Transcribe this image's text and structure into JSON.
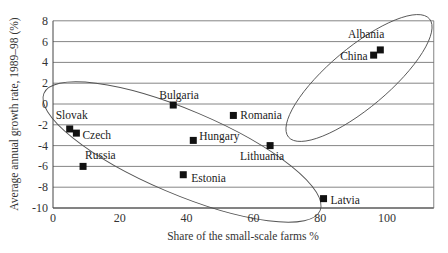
{
  "chart_data": {
    "type": "scatter",
    "title": "",
    "xlabel": "Share of the small-scale farms %",
    "ylabel": "Average annual growth rate, 1989–98 (%)",
    "xlim": [
      0,
      114
    ],
    "ylim": [
      -10,
      8
    ],
    "xticks": [
      0,
      20,
      40,
      60,
      80,
      100
    ],
    "yticks": [
      8,
      6,
      4,
      2,
      0,
      -2,
      -4,
      -6,
      -8,
      -10
    ],
    "grid": "horizontal",
    "legend": "none",
    "points": [
      {
        "label": "Slovak",
        "x": 5,
        "y": -2.4
      },
      {
        "label": "Czech",
        "x": 7,
        "y": -2.8
      },
      {
        "label": "Russia",
        "x": 9,
        "y": -6.0
      },
      {
        "label": "Bulgaria",
        "x": 36,
        "y": -0.1
      },
      {
        "label": "Romania",
        "x": 54,
        "y": -1.1
      },
      {
        "label": "Hungary",
        "x": 42,
        "y": -3.5
      },
      {
        "label": "Lithuania",
        "x": 65,
        "y": -4.0
      },
      {
        "label": "Estonia",
        "x": 39,
        "y": -6.8
      },
      {
        "label": "Latvia",
        "x": 81,
        "y": -9.1
      },
      {
        "label": "China",
        "x": 96,
        "y": 4.7
      },
      {
        "label": "Albania",
        "x": 98,
        "y": 5.2
      }
    ],
    "annotations": [
      "ellipse enclosing Albania and China",
      "ellipse enclosing Slovak, Czech, Russia, Bulgaria, Hungary, Estonia, Lithuania, Latvia"
    ]
  }
}
